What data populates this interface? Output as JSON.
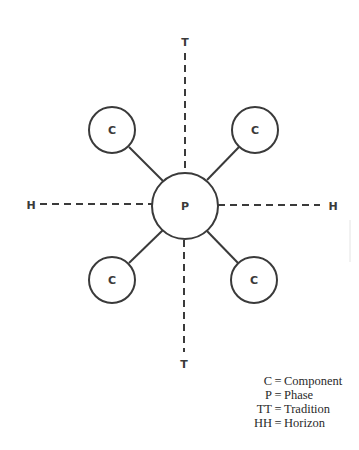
{
  "diagram": {
    "center_node": {
      "label": "P",
      "meaning": "Phase"
    },
    "component_nodes": [
      {
        "label": "C",
        "position": "upper-left"
      },
      {
        "label": "C",
        "position": "upper-right"
      },
      {
        "label": "C",
        "position": "lower-left"
      },
      {
        "label": "C",
        "position": "lower-right"
      }
    ],
    "axes": {
      "vertical": {
        "top_label": "T",
        "bottom_label": "T",
        "style": "dashed"
      },
      "horizontal": {
        "left_label": "H",
        "right_label": "H",
        "style": "dashed"
      }
    },
    "colors": {
      "stroke": "#3a3a3a",
      "background": "#ffffff"
    }
  },
  "legend": {
    "items": [
      {
        "key": "C",
        "eq": "=",
        "value": "Component"
      },
      {
        "key": "P",
        "eq": "=",
        "value": "Phase"
      },
      {
        "key": "TT",
        "eq": "=",
        "value": "Tradition"
      },
      {
        "key": "HH",
        "eq": "=",
        "value": "Horizon"
      }
    ]
  }
}
